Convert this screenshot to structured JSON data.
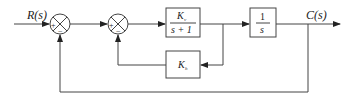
{
  "diagram": {
    "type": "control-system-block-diagram",
    "input": {
      "label": "R(s)"
    },
    "output": {
      "label": "C(s)"
    },
    "summing_junctions": [
      {
        "id": "sum1",
        "signs": [
          "+",
          "−"
        ]
      },
      {
        "id": "sum2",
        "signs": [
          "+",
          "−"
        ]
      }
    ],
    "blocks": [
      {
        "id": "forward-block",
        "numerator": "K",
        "numerator_sub": "v",
        "denominator": "s + 1"
      },
      {
        "id": "integrator-block",
        "numerator": "1",
        "denominator": "s"
      },
      {
        "id": "feedback-block",
        "label": "K",
        "label_sub": "h"
      }
    ],
    "edges": [
      "R(s) → sum1 (+)",
      "sum1 → sum2 (+)",
      "sum2 → Kv/(s+1)",
      "Kv/(s+1) → 1/s",
      "1/s → C(s)",
      "Kv/(s+1) output → Kh → sum2 (−)",
      "C(s) → sum1 (−)"
    ]
  }
}
